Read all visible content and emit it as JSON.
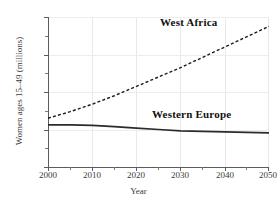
{
  "chart_data": {
    "type": "line",
    "title": "",
    "xlabel": "Year",
    "ylabel": "Women ages 15–49 (millions)",
    "xlim": [
      2000,
      2050
    ],
    "ylim": [
      0,
      160
    ],
    "grid": true,
    "legend_position": "inline-annotation",
    "x": [
      2000,
      2005,
      2010,
      2015,
      2020,
      2025,
      2030,
      2035,
      2040,
      2045,
      2050
    ],
    "xticks": [
      2000,
      2010,
      2020,
      2030,
      2040,
      2050
    ],
    "xticks_minor": [
      2005,
      2015,
      2025,
      2035,
      2045
    ],
    "yticks": [
      0,
      40,
      80,
      120,
      160
    ],
    "yticks_minor": [
      20,
      60,
      100,
      140
    ],
    "series": [
      {
        "name": "West Africa",
        "style": "dashed",
        "color": "#1a1a1a",
        "values": [
          52,
          59,
          67,
          76,
          86,
          96,
          106,
          117,
          128,
          139,
          150
        ]
      },
      {
        "name": "Western Europe",
        "style": "solid",
        "color": "#2b2b2b",
        "values": [
          45,
          45,
          44.5,
          43,
          41.5,
          40,
          38.5,
          38,
          37.5,
          37,
          36.5
        ]
      }
    ]
  },
  "axes": {
    "y_tick_labels": [
      "160",
      "120",
      "80",
      "40",
      "0"
    ],
    "x_tick_labels": [
      "2000",
      "2010",
      "2020",
      "2030",
      "2040",
      "2050"
    ],
    "x_axis_title": "Year",
    "y_axis_title": "Women ages 15–49 (millions)"
  },
  "annotations": {
    "west_africa_label": "West Africa",
    "western_europe_label": "Western Europe"
  }
}
